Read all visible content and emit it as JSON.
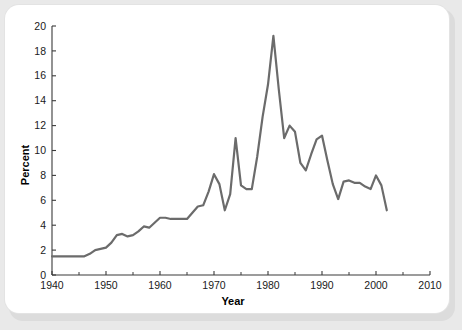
{
  "chart_data": {
    "type": "line",
    "title": "",
    "xlabel": "Year",
    "ylabel": "Percent",
    "xlim": [
      1940,
      2010
    ],
    "ylim": [
      0,
      20
    ],
    "xticks": [
      1940,
      1950,
      1960,
      1970,
      1980,
      1990,
      2000,
      2010
    ],
    "xtick_labels": [
      "1940",
      "1950",
      "1960",
      "1970",
      "1980",
      "1990",
      "2000",
      "2010"
    ],
    "x_minor_ticks": [
      1945,
      1955,
      1965,
      1975,
      1985,
      1995,
      2005
    ],
    "yticks": [
      0,
      2,
      4,
      6,
      8,
      10,
      12,
      14,
      16,
      18,
      20
    ],
    "ytick_labels": [
      "0",
      "2",
      "4",
      "6",
      "8",
      "10",
      "12",
      "14",
      "16",
      "18",
      "20"
    ],
    "grid": false,
    "legend": false,
    "legend_position": "none",
    "line_color": "#6b6b6b",
    "line_width": 2.2,
    "x": [
      1940,
      1941,
      1942,
      1943,
      1944,
      1945,
      1946,
      1947,
      1948,
      1949,
      1950,
      1951,
      1952,
      1953,
      1954,
      1955,
      1956,
      1957,
      1958,
      1959,
      1960,
      1961,
      1962,
      1963,
      1964,
      1965,
      1966,
      1967,
      1968,
      1969,
      1970,
      1971,
      1972,
      1973,
      1974,
      1975,
      1976,
      1977,
      1978,
      1979,
      1980,
      1981,
      1982,
      1983,
      1984,
      1985,
      1986,
      1987,
      1988,
      1989,
      1990,
      1991,
      1992,
      1993,
      1994,
      1995,
      1996,
      1997,
      1998,
      1999,
      2000,
      2001,
      2002
    ],
    "values": [
      1.5,
      1.5,
      1.5,
      1.5,
      1.5,
      1.5,
      1.5,
      1.7,
      2.0,
      2.1,
      2.2,
      2.6,
      3.2,
      3.3,
      3.1,
      3.2,
      3.5,
      3.9,
      3.8,
      4.2,
      4.6,
      4.6,
      4.5,
      4.5,
      4.5,
      4.5,
      5.0,
      5.5,
      5.6,
      6.7,
      8.1,
      7.3,
      5.2,
      6.5,
      11.0,
      7.2,
      6.9,
      6.9,
      9.5,
      12.7,
      15.3,
      19.2,
      14.9,
      11.0,
      12.0,
      11.5,
      9.0,
      8.4,
      9.7,
      10.9,
      11.2,
      9.2,
      7.3,
      6.1,
      7.5,
      7.6,
      7.4,
      7.4,
      7.1,
      6.9,
      8.0,
      7.2,
      5.2
    ]
  }
}
